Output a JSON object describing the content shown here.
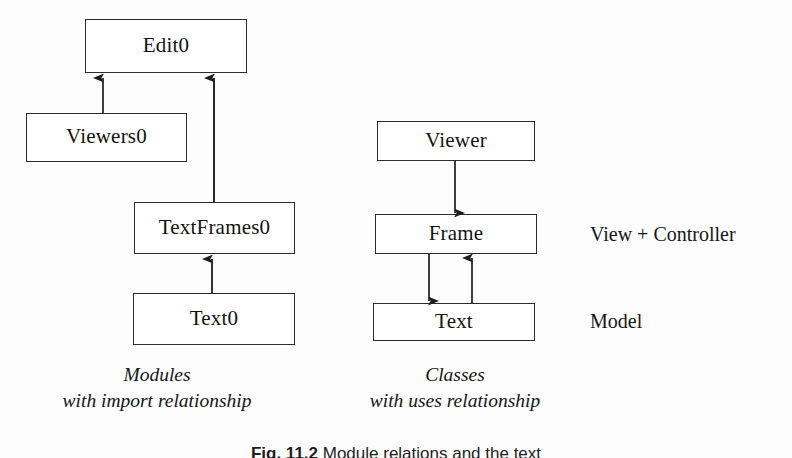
{
  "figure": {
    "background_color": "#fdfdfd",
    "stroke_color": "#2b2b2b",
    "text_color": "#121212"
  },
  "left_group": {
    "caption_line1": "Modules",
    "caption_line2": "with import relationship",
    "nodes": [
      {
        "id": "edit0",
        "label": "Edit0"
      },
      {
        "id": "viewers0",
        "label": "Viewers0"
      },
      {
        "id": "textframes0",
        "label": "TextFrames0"
      },
      {
        "id": "text0",
        "label": "Text0"
      }
    ],
    "edges": [
      {
        "from": "viewers0",
        "to": "edit0",
        "direction": "up"
      },
      {
        "from": "textframes0",
        "to": "edit0",
        "direction": "up"
      },
      {
        "from": "text0",
        "to": "textframes0",
        "direction": "up"
      }
    ]
  },
  "right_group": {
    "caption_line1": "Classes",
    "caption_line2": "with uses relationship",
    "nodes": [
      {
        "id": "viewer",
        "label": "Viewer"
      },
      {
        "id": "frame",
        "label": "Frame"
      },
      {
        "id": "text",
        "label": "Text"
      }
    ],
    "edges": [
      {
        "from": "viewer",
        "to": "frame",
        "direction": "down"
      },
      {
        "from": "frame",
        "to": "text",
        "direction": "down"
      },
      {
        "from": "text",
        "to": "frame",
        "direction": "up"
      }
    ],
    "annotations": [
      {
        "id": "view-controller",
        "label": "View + Controller"
      },
      {
        "id": "model",
        "label": "Model"
      }
    ]
  },
  "figure_caption": {
    "number": "Fig. 11.2",
    "text": "Module relations and the text"
  }
}
